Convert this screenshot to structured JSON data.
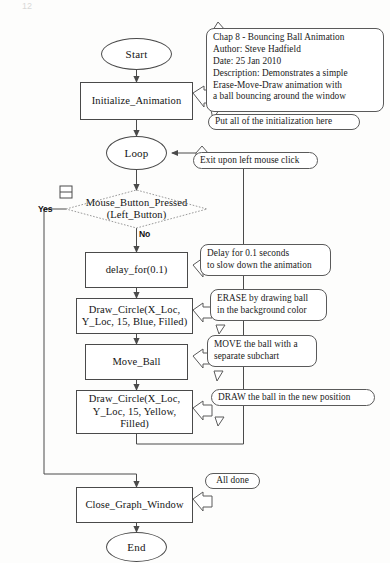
{
  "document": {
    "title": "Chap 8 - Bouncing Ball Animation flowchart",
    "page_header_left": "12",
    "page_header_right": ""
  },
  "nodes": {
    "start": {
      "label": "Start",
      "shape": "terminator"
    },
    "initialize": {
      "label": "Initialize_Animation",
      "shape": "process"
    },
    "loop": {
      "label": "Loop",
      "shape": "terminator"
    },
    "decision": {
      "line1": "Mouse_Button_Pressed",
      "line2": "(Left_Button)",
      "shape": "decision",
      "yes_label": "Yes",
      "no_label": "No"
    },
    "delay": {
      "label": "delay_for(0.1)",
      "shape": "process"
    },
    "erase_circle": {
      "line1": "Draw_Circle(X_Loc,",
      "line2": "Y_Loc,  15,  Blue,  Filled)",
      "shape": "process"
    },
    "move_ball": {
      "label": "Move_Ball",
      "shape": "process"
    },
    "draw_circle": {
      "line1": "Draw_Circle(X_Loc,",
      "line2": "Y_Loc,  15,  Yellow,",
      "line3": "Filled)",
      "shape": "process"
    },
    "close_window": {
      "label": "Close_Graph_Window",
      "shape": "process"
    },
    "end": {
      "label": "End",
      "shape": "terminator"
    }
  },
  "callouts": {
    "header_comment": {
      "lines": [
        "Chap 8 - Bouncing Ball Animation",
        "Author:  Steve Hadfield",
        "Date:  25 Jan 2010",
        "Description:  Demonstrates a simple",
        " Erase-Move-Draw animation with",
        " a ball bouncing around the window"
      ]
    },
    "init_comment": {
      "lines": [
        "Put all of the initialization here"
      ]
    },
    "exit_comment": {
      "lines": [
        "Exit upon left mouse click"
      ]
    },
    "delay_comment": {
      "lines": [
        "Delay for 0.1 seconds",
        "to slow down the animation"
      ]
    },
    "erase_comment": {
      "lines": [
        "ERASE by drawing ball",
        "in the background color"
      ]
    },
    "move_comment": {
      "lines": [
        "MOVE the ball with a",
        "separate subchart"
      ]
    },
    "draw_comment": {
      "lines": [
        "DRAW the ball in the new position"
      ]
    },
    "done_comment": {
      "lines": [
        "All done"
      ]
    }
  },
  "icons": {
    "collapse_marker": "collapse-expand-icon"
  },
  "colors": {
    "stroke": "#4a4a4a",
    "text": "#141414",
    "background": "#fdfdfc",
    "decision_stroke": "#8d8d8d"
  }
}
